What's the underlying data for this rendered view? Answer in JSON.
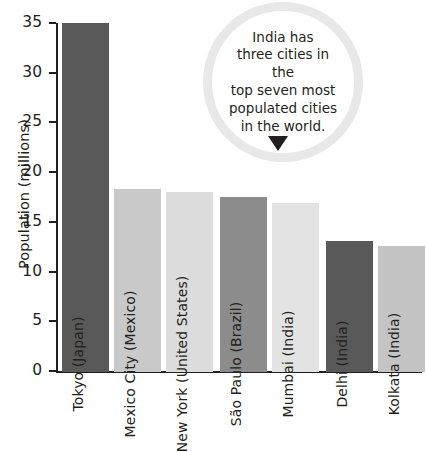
{
  "chart_data": {
    "type": "bar",
    "title": "",
    "xlabel": "",
    "ylabel": "Population (millions)",
    "ylim": [
      0,
      35
    ],
    "grid": false,
    "legend": null,
    "yticks": [
      35,
      30,
      25,
      20,
      15,
      10,
      5,
      0
    ],
    "categories": [
      "Tokyo (Japan)",
      "Mexico City (Mexico)",
      "New York (United States)",
      "São Paulo (Brazil)",
      "Mumbai (India)",
      "Delhi (India)",
      "Kolkata (India)"
    ],
    "values": [
      35.0,
      18.4,
      18.1,
      17.6,
      17.0,
      13.1,
      12.6
    ],
    "bar_colors": [
      "#595959",
      "#c9c9c9",
      "#dcdcdc",
      "#8c8c8c",
      "#e3e3e3",
      "#595959",
      "#c4c4c4"
    ],
    "annotations": [
      {
        "name": "india-callout",
        "text": "India has three cities in the top seven most populated cities in the world.",
        "lines": [
          "India has",
          "three cities in the",
          "top seven most",
          "populated cities",
          "in the world."
        ],
        "shape": "circle",
        "pointer": "down-arrow"
      }
    ]
  },
  "colors": {
    "axis": "#231f20",
    "text": "#231f20",
    "bubble_ring": "#e8e8e8",
    "background": "#ffffff"
  }
}
